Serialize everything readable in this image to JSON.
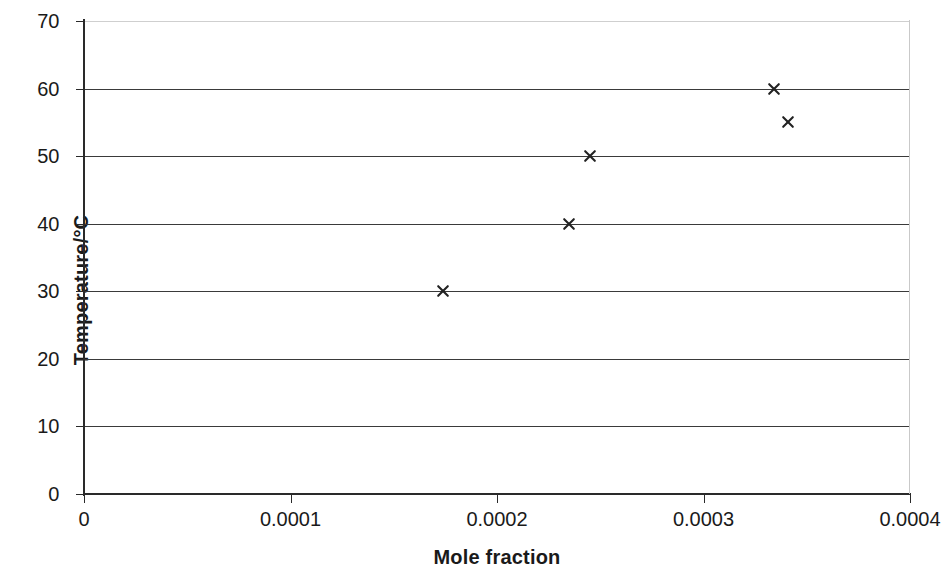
{
  "chart_data": {
    "type": "scatter",
    "title": "",
    "xlabel": "Mole fraction",
    "ylabel": "Temperature/°C",
    "xlim": [
      0,
      0.0004
    ],
    "ylim": [
      0,
      70
    ],
    "grid": "horizontal",
    "legend": "none",
    "marker": "x",
    "marker_color": "#222222",
    "x_ticks": [
      "0",
      "0.0001",
      "0.0002",
      "0.0003",
      "0.0004"
    ],
    "x_tick_values": [
      0,
      0.0001,
      0.0002,
      0.0003,
      0.0004
    ],
    "y_ticks": [
      "0",
      "10",
      "20",
      "30",
      "40",
      "50",
      "60",
      "70"
    ],
    "y_tick_values": [
      0,
      10,
      20,
      30,
      40,
      50,
      60,
      70
    ],
    "series": [
      {
        "name": "solubility data",
        "points": [
          {
            "x": 0.000174,
            "y": 30
          },
          {
            "x": 0.000235,
            "y": 40
          },
          {
            "x": 0.000245,
            "y": 50
          },
          {
            "x": 0.000334,
            "y": 60
          },
          {
            "x": 0.000341,
            "y": 55
          }
        ]
      }
    ]
  },
  "colors": {
    "axis": "#2a2a2a",
    "gridline": "#3a3a3a",
    "background": "#ffffff",
    "text": "#1a1a1a"
  }
}
